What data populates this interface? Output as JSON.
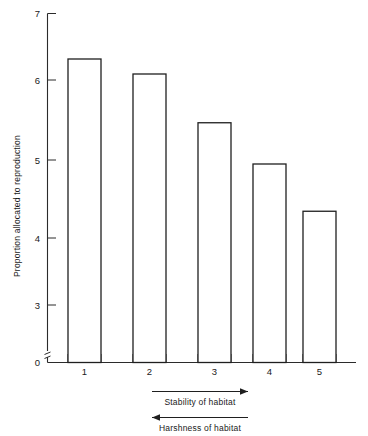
{
  "chart_data": {
    "type": "bar",
    "title": "",
    "xlabel": "Stability of habitat",
    "ylabel": "Proportion allocated to reproduction",
    "categories": [
      "1",
      "2",
      "3",
      "4",
      "5"
    ],
    "values": [
      6.28,
      6.08,
      5.43,
      4.88,
      4.25
    ],
    "ylim": [
      0,
      7
    ],
    "y_ticks": [
      "0",
      "3",
      "4",
      "5",
      "6",
      "7"
    ],
    "y_axis_break": true,
    "grid": false,
    "legend": null,
    "bar_style": "hollow-outline",
    "annotations": [
      {
        "text": "Stability of habitat",
        "direction": "right"
      },
      {
        "text": "Harshness of habitat",
        "direction": "left"
      }
    ]
  },
  "axes": {
    "y_label": "Proportion allocated to reproduction",
    "y_tick_0": "0",
    "y_tick_3": "3",
    "y_tick_4": "4",
    "y_tick_5": "5",
    "y_tick_6": "6",
    "y_tick_7": "7",
    "x_tick_1": "1",
    "x_tick_2": "2",
    "x_tick_3": "3",
    "x_tick_4": "4",
    "x_tick_5": "5"
  },
  "annotations": {
    "stability": "Stability of habitat",
    "harshness": "Harshness of habitat"
  },
  "colors": {
    "ink": "#1f1f1f",
    "axis": "#2b2b2b",
    "background": "#ffffff",
    "bar_fill": "#ffffff"
  }
}
